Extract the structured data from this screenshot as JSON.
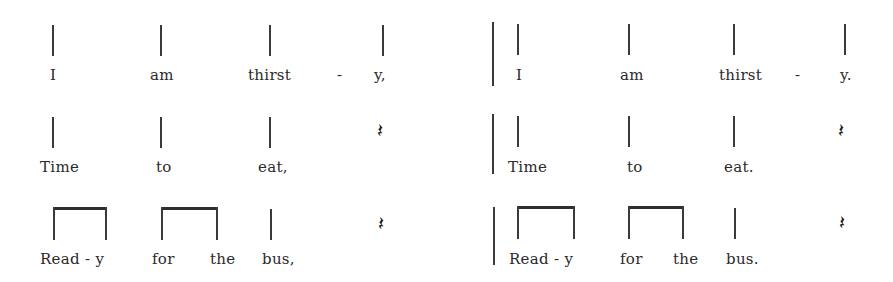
{
  "left_block": {
    "row1": {
      "words": [
        "I",
        "am",
        "thirst",
        "-",
        "y,"
      ]
    },
    "row2": {
      "words": [
        "Time",
        "to",
        "eat,"
      ],
      "rest": "𝄽"
    },
    "row3": {
      "words": [
        "Read - y",
        "for",
        "the",
        "bus,"
      ],
      "rest": "𝄽"
    }
  },
  "right_block": {
    "row1": {
      "words": [
        "I",
        "am",
        "thirst",
        "-",
        "y."
      ]
    },
    "row2": {
      "words": [
        "Time",
        "to",
        "eat."
      ],
      "rest": "𝄽"
    },
    "row3": {
      "words": [
        "Read - y",
        "for",
        "the",
        "bus."
      ],
      "rest": "𝄽"
    }
  },
  "notation": {
    "row1_rhythm": [
      "quarter",
      "quarter",
      "quarter",
      "quarter"
    ],
    "row2_rhythm": [
      "quarter",
      "quarter",
      "quarter",
      "quarter-rest"
    ],
    "row3_rhythm": [
      "eighth-pair",
      "eighth-pair",
      "quarter",
      "quarter-rest"
    ]
  }
}
